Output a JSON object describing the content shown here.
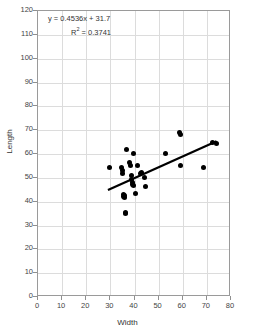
{
  "chart_data": {
    "type": "scatter",
    "title": "",
    "xlabel": "Width",
    "ylabel": "Length",
    "xlim": [
      0,
      80
    ],
    "ylim": [
      0,
      120
    ],
    "xticks": [
      0,
      10,
      20,
      30,
      40,
      50,
      60,
      70,
      80
    ],
    "yticks": [
      0,
      10,
      20,
      30,
      40,
      50,
      60,
      70,
      80,
      90,
      100,
      110,
      120
    ],
    "grid": true,
    "legend": "none",
    "marker_color": "#000000",
    "gridline_color": "#dcdcdc",
    "frame_color": "#9a9a9a",
    "annotations": {
      "equation": "y = 0.4536x + 31.7",
      "r_squared_label": "R",
      "r_squared_exponent": "2",
      "r_squared_value": "= 0.3741",
      "r_squared_full": "R2 = 0.3741"
    },
    "trendline": {
      "type": "linear",
      "slope": 0.4536,
      "intercept": 31.7,
      "x_start": 29,
      "x_end": 74,
      "y_start": 44.9,
      "y_end": 65.3,
      "color": "#000000"
    },
    "points": [
      {
        "x": 29.8,
        "y": 54.2
      },
      {
        "x": 34.6,
        "y": 54.3
      },
      {
        "x": 35.0,
        "y": 53.0
      },
      {
        "x": 35.2,
        "y": 51.7
      },
      {
        "x": 35.4,
        "y": 43.2
      },
      {
        "x": 35.6,
        "y": 42.3
      },
      {
        "x": 35.8,
        "y": 41.8
      },
      {
        "x": 36.0,
        "y": 42.6
      },
      {
        "x": 36.2,
        "y": 35.6
      },
      {
        "x": 36.4,
        "y": 35.2
      },
      {
        "x": 36.6,
        "y": 61.9
      },
      {
        "x": 37.8,
        "y": 56.3
      },
      {
        "x": 38.2,
        "y": 55.2
      },
      {
        "x": 38.6,
        "y": 50.8
      },
      {
        "x": 38.8,
        "y": 49.1
      },
      {
        "x": 39.0,
        "y": 48.0
      },
      {
        "x": 39.2,
        "y": 47.3
      },
      {
        "x": 39.4,
        "y": 46.6
      },
      {
        "x": 39.6,
        "y": 60.1
      },
      {
        "x": 40.4,
        "y": 43.3
      },
      {
        "x": 41.2,
        "y": 55.1
      },
      {
        "x": 42.4,
        "y": 51.9
      },
      {
        "x": 43.0,
        "y": 52.3
      },
      {
        "x": 44.2,
        "y": 50.3
      },
      {
        "x": 44.6,
        "y": 46.3
      },
      {
        "x": 53.0,
        "y": 60.1
      },
      {
        "x": 58.8,
        "y": 68.9
      },
      {
        "x": 58.9,
        "y": 68.1
      },
      {
        "x": 59.2,
        "y": 55.3
      },
      {
        "x": 68.8,
        "y": 54.4
      },
      {
        "x": 72.2,
        "y": 64.8
      },
      {
        "x": 74.0,
        "y": 64.2
      }
    ]
  }
}
